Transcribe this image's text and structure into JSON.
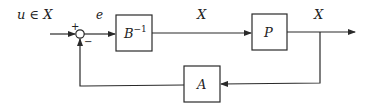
{
  "diagram": {
    "type": "feedback-block-diagram",
    "input_label": "u ∈ X",
    "error_label": "e",
    "mid_signal_label": "X",
    "output_label": "X",
    "summing_junction": {
      "plus_sign": "+",
      "minus_sign": "−"
    },
    "blocks": {
      "b_inverse": {
        "base": "B",
        "superscript": "−1"
      },
      "p": {
        "label": "P"
      },
      "a": {
        "label": "A"
      }
    },
    "colors": {
      "line": "#2a2a2a",
      "background": "#ffffff",
      "text": "#222222"
    }
  }
}
